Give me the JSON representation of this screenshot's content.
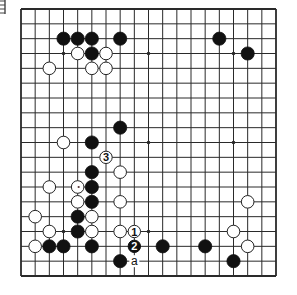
{
  "diagram": {
    "type": "go-board",
    "size": 19,
    "colors": {
      "background": "#ffffff",
      "line": "#2a2a2a",
      "black_stone": "#111111",
      "white_stone": "#ffffff",
      "stone_outline": "#222222"
    },
    "star_points": [
      [
        3,
        3
      ],
      [
        9,
        3
      ],
      [
        15,
        3
      ],
      [
        3,
        9
      ],
      [
        9,
        9
      ],
      [
        15,
        9
      ],
      [
        3,
        15
      ],
      [
        9,
        15
      ],
      [
        15,
        15
      ]
    ],
    "black_stones": [
      [
        3,
        2
      ],
      [
        4,
        2
      ],
      [
        5,
        2
      ],
      [
        7,
        2
      ],
      [
        14,
        2
      ],
      [
        5,
        3
      ],
      [
        16,
        3
      ],
      [
        7,
        8
      ],
      [
        5,
        9
      ],
      [
        5,
        11
      ],
      [
        5,
        12
      ],
      [
        5,
        13
      ],
      [
        4,
        14
      ],
      [
        4,
        15
      ],
      [
        2,
        16
      ],
      [
        3,
        16
      ],
      [
        5,
        16
      ],
      [
        10,
        16
      ],
      [
        13,
        16
      ],
      [
        7,
        17
      ],
      [
        15,
        17
      ]
    ],
    "white_stones": [
      [
        4,
        3
      ],
      [
        6,
        3
      ],
      [
        2,
        4
      ],
      [
        5,
        4
      ],
      [
        6,
        4
      ],
      [
        3,
        9
      ],
      [
        7,
        11
      ],
      [
        2,
        12
      ],
      [
        4,
        12
      ],
      [
        4,
        13
      ],
      [
        7,
        13
      ],
      [
        16,
        13
      ],
      [
        1,
        14
      ],
      [
        5,
        14
      ],
      [
        2,
        15
      ],
      [
        5,
        15
      ],
      [
        7,
        15
      ],
      [
        15,
        15
      ],
      [
        1,
        16
      ],
      [
        16,
        16
      ]
    ],
    "numbered_moves": [
      {
        "number": "1",
        "color": "white",
        "col": 8,
        "row": 15
      },
      {
        "number": "2",
        "color": "black",
        "col": 8,
        "row": 16
      },
      {
        "number": "3",
        "color": "white",
        "col": 6,
        "row": 10
      }
    ],
    "letter_labels": [
      {
        "text": "a",
        "col": 8,
        "row": 17
      }
    ],
    "marks": [
      {
        "type": "dot",
        "col": 4,
        "row": 12
      }
    ]
  }
}
